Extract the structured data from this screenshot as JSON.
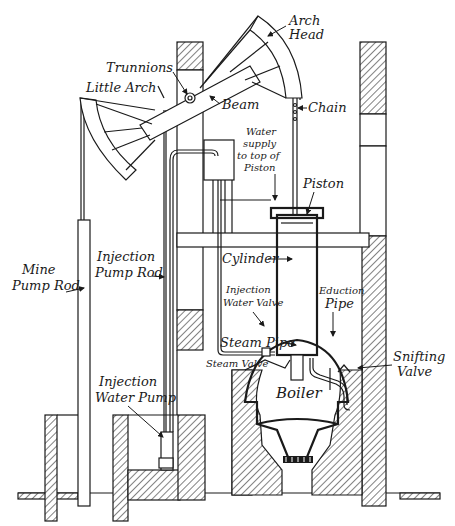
{
  "diagram": {
    "colors": {
      "ink": "#1a1a1a",
      "paper": "#ffffff"
    },
    "labels": {
      "arch_head": [
        "Arch",
        "Head"
      ],
      "trunnions": "Trunnions",
      "little_arch": "Little Arch",
      "beam": "Beam",
      "chain": "Chain",
      "water_supply": [
        "Water",
        "supply",
        "to top of",
        "Piston"
      ],
      "piston": "Piston",
      "cylinder": "Cylinder",
      "mine_pump_rod": [
        "Mine",
        "Pump Rod"
      ],
      "injection_pump_rod": [
        "Injection",
        "Pump Rod"
      ],
      "injection_water_valve": [
        "Injection",
        "Water Valve"
      ],
      "eduction_pipe": [
        "Eduction",
        "Pipe"
      ],
      "steam_pipe": "Steam Pipe",
      "steam_valve": "Steam Valve",
      "snifting_valve": [
        "Snifting",
        "Valve"
      ],
      "boiler": "Boiler",
      "injection_water_pump": [
        "Injection",
        "Water Pump"
      ]
    }
  }
}
